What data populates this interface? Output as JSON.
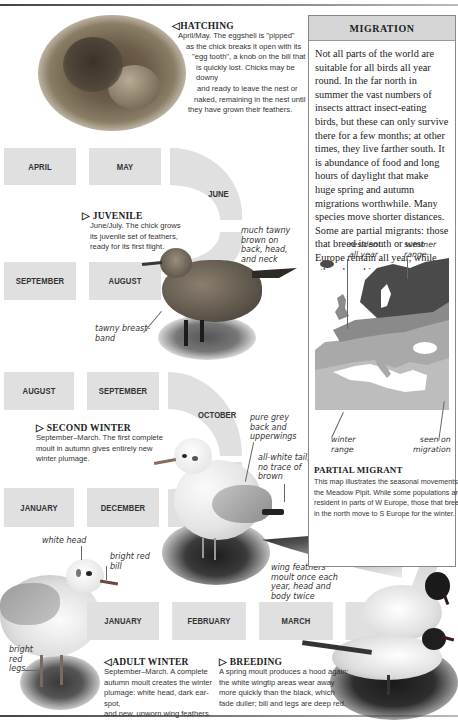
{
  "page": {
    "top_rule": true,
    "bottom_rule": true
  },
  "hatching": {
    "heading": "HATCHING",
    "arrow": "◁",
    "lines": [
      "April/May. The eggshell is \"pipped\"",
      "as the chick breaks it open with its",
      "\"egg tooth\", a knob on the bill that",
      "is quickly lost. Chicks may be downy",
      "and ready to leave the nest or",
      "naked, remaining in the nest until",
      "they have grown their feathers."
    ]
  },
  "juvenile": {
    "heading": "JUVENILE",
    "arrow": "▷",
    "lines": [
      "June/July. The chick grows",
      "its juvenile set of feathers,",
      "ready for its first flight."
    ],
    "notes": {
      "tawny_brown": [
        "much tawny",
        "brown on",
        "back, head,",
        "and neck"
      ],
      "breast_band": [
        "tawny breast-",
        "band"
      ]
    }
  },
  "second_winter": {
    "heading": "SECOND WINTER",
    "arrow": "▷",
    "lines": [
      "September–March. The first complete",
      "moult in autumn gives entirely new",
      "winter plumage."
    ],
    "notes": {
      "grey_back": [
        "pure grey",
        "back and",
        "upperwings"
      ],
      "white_tail": [
        "all-white tail,",
        "no trace of",
        "brown"
      ]
    }
  },
  "adult_winter": {
    "heading": "ADULT WINTER",
    "arrow": "◁",
    "lines": [
      "September–March. A complete",
      "autumn moult creates the winter",
      "plumage: white head, dark ear-spot,",
      "and new, unworn wing feathers."
    ],
    "notes": {
      "white_head": [
        "white head"
      ],
      "red_bill": [
        "bright red",
        "bill"
      ],
      "red_legs": [
        "bright",
        "red",
        "legs"
      ]
    }
  },
  "breeding": {
    "heading": "BREEDING",
    "arrow": "▷",
    "lines": [
      "A spring moult produces a hood again;",
      "the white wingtip areas wear away",
      "more quickly than the black, which",
      "fade duller; bill and legs are deep red."
    ],
    "notes": {
      "wing_feathers": [
        "wing feathers",
        "moult once each",
        "year, head and",
        "body twice"
      ]
    }
  },
  "timeline": {
    "upper": {
      "top_row": [
        "APRIL",
        "MAY"
      ],
      "curve": "JUNE",
      "bottom_row": [
        "SEPTEMBER",
        "AUGUST"
      ]
    },
    "middle": {
      "top_row": [
        "AUGUST",
        "SEPTEMBER"
      ],
      "curve": "OCTOBER",
      "bottom_row": [
        "JANUARY",
        "DECEMBER"
      ]
    },
    "lower": {
      "row": [
        "JANUARY",
        "FEBRUARY",
        "MARCH",
        ""
      ]
    }
  },
  "migration": {
    "title": "MIGRATION",
    "text": "Not all parts of the world are suitable for all birds all year round. In the far north in summer the vast numbers of insects attract insect-eating birds, but these can only survive there for a few months; at other times, they live farther south. It is abundance of food and long hours of daylight that make huge spring and autumn migrations worthwhile. Many species move shorter distances. Some are partial migrants: those that breed in south or west Europe remain all year, while others breed in the north and move south each autumn. Birds that stay in one place all year are called residents.",
    "map": {
      "labels": {
        "resident": [
          "resident",
          "all year"
        ],
        "summer": [
          "summer",
          "range"
        ],
        "winter": [
          "winter",
          "range"
        ],
        "migration": [
          "seen on",
          "migration"
        ]
      },
      "colors": {
        "summer": "#4a4a4a",
        "resident": "#8a8a8a",
        "winter": "#a9a9a9",
        "migration": "#bdbdbd",
        "sea": "#ffffff"
      }
    },
    "caption_heading": "PARTIAL MIGRANT",
    "caption_lines": [
      "This map illustrates the seasonal movements of",
      "the Meadow Pipit. While some populations are",
      "resident in parts of W Europe, those that breed",
      "in the north move to S Europe for the winter."
    ]
  },
  "colors": {
    "band": "#e0e0e0",
    "panel_header": "#d6d6d6",
    "panel_border": "#888888",
    "text": "#222222"
  }
}
